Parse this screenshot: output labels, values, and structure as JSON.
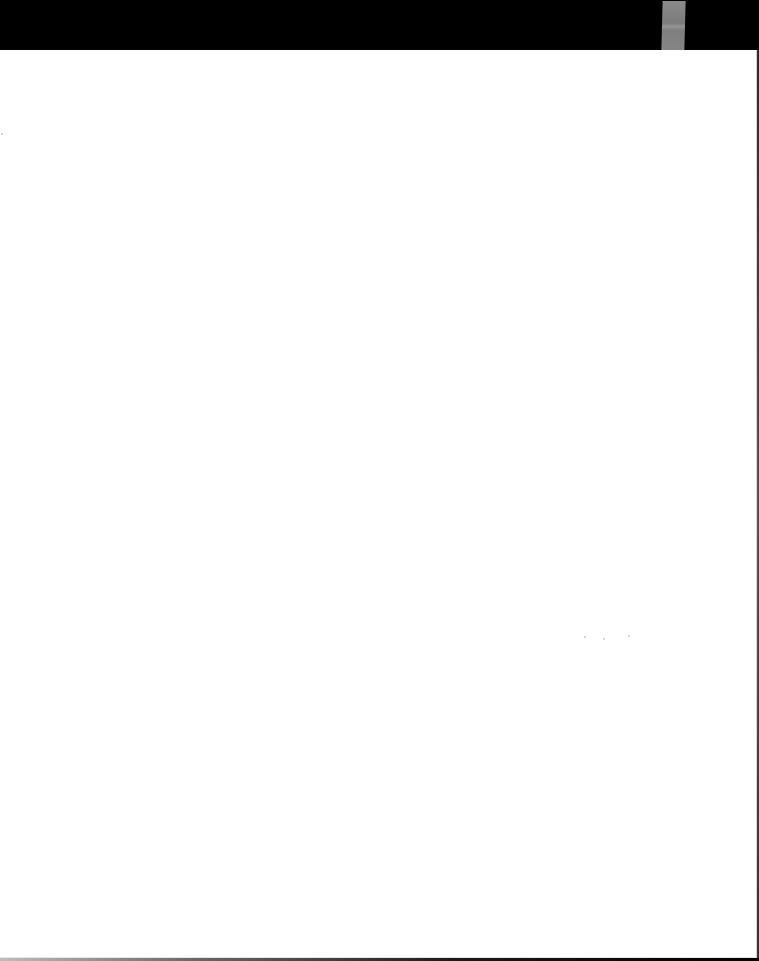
{
  "document": {
    "type": "blank scanned page",
    "text_content": "",
    "colors": {
      "scanner_band": "#000000",
      "tab_marker": "#808080",
      "page": "#ffffff"
    }
  }
}
